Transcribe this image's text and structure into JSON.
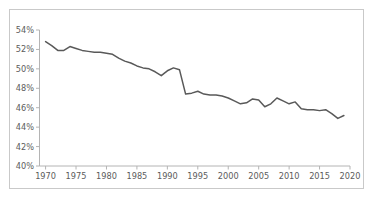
{
  "chart_data": {
    "type": "line",
    "title": "",
    "subtitle": "",
    "xlabel": "",
    "ylabel": "",
    "xlim": [
      1969,
      2020
    ],
    "ylim": [
      40,
      54
    ],
    "grid": false,
    "legend": null,
    "legend_position": "none",
    "y_unit": "percent",
    "y_tick_labels": [
      "40%",
      "42%",
      "44%",
      "46%",
      "48%",
      "50%",
      "52%",
      "54%"
    ],
    "y_ticks": [
      40,
      42,
      44,
      46,
      48,
      50,
      52,
      54
    ],
    "x_tick_labels": [
      "1970",
      "1975",
      "1980",
      "1985",
      "1990",
      "1995",
      "2000",
      "2005",
      "2010",
      "2015",
      "2020"
    ],
    "x_ticks": [
      1970,
      1975,
      1980,
      1985,
      1990,
      1995,
      2000,
      2005,
      2010,
      2015,
      2020
    ],
    "series": [
      {
        "name": "rate",
        "color": "#595959",
        "x": [
          1970,
          1971,
          1972,
          1973,
          1974,
          1975,
          1976,
          1977,
          1978,
          1979,
          1980,
          1981,
          1982,
          1983,
          1984,
          1985,
          1986,
          1987,
          1988,
          1989,
          1990,
          1991,
          1992,
          1993,
          1994,
          1995,
          1996,
          1997,
          1998,
          1999,
          2000,
          2001,
          2002,
          2003,
          2004,
          2005,
          2006,
          2007,
          2008,
          2009,
          2010,
          2011,
          2012,
          2013,
          2014,
          2015,
          2016,
          2017,
          2018,
          2019
        ],
        "values": [
          52.8,
          52.4,
          51.9,
          51.9,
          52.3,
          52.1,
          51.9,
          51.8,
          51.7,
          51.7,
          51.6,
          51.5,
          51.1,
          50.8,
          50.6,
          50.3,
          50.1,
          50.0,
          49.7,
          49.3,
          49.8,
          50.1,
          49.9,
          47.4,
          47.5,
          47.7,
          47.4,
          47.3,
          47.3,
          47.2,
          47.0,
          46.7,
          46.4,
          46.5,
          46.9,
          46.8,
          46.1,
          46.4,
          47.0,
          46.7,
          46.4,
          46.6,
          45.9,
          45.8,
          45.8,
          45.7,
          45.8,
          45.4,
          44.9,
          45.2
        ]
      }
    ]
  }
}
